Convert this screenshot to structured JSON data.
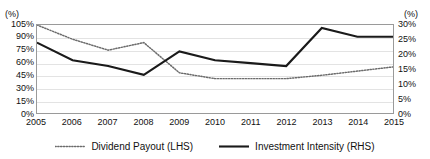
{
  "axes": {
    "left_unit": "(%)",
    "right_unit": "(%)",
    "left_ticks": [
      "105%",
      "90%",
      "75%",
      "60%",
      "45%",
      "30%",
      "15%",
      "0%"
    ],
    "right_ticks": [
      "30%",
      "25%",
      "20%",
      "15%",
      "10%",
      "5%",
      "0%"
    ]
  },
  "legend": {
    "items": [
      {
        "label": "Dividend Payout (LHS)",
        "style": "dotted",
        "color": "#6b6b6b"
      },
      {
        "label": "Investment Intensity (RHS)",
        "style": "solid",
        "color": "#1a1a1a"
      }
    ]
  },
  "chart_data": {
    "type": "line",
    "title": "",
    "xlabel": "",
    "ylabel": "(%)",
    "y2label": "(%)",
    "grid": true,
    "legend_position": "bottom",
    "categories": [
      "2005",
      "2006",
      "2007",
      "2008",
      "2009",
      "2010",
      "2011",
      "2012",
      "2013",
      "2014",
      "2015"
    ],
    "ylim": [
      0,
      105
    ],
    "y2lim": [
      0,
      30
    ],
    "yticks": [
      0,
      15,
      30,
      45,
      60,
      75,
      90,
      105
    ],
    "y2ticks": [
      0,
      5,
      10,
      15,
      20,
      25,
      30
    ],
    "series": [
      {
        "name": "Dividend Payout (LHS)",
        "axis": "left",
        "style": "dotted",
        "color": "#6b6b6b",
        "values": [
          105,
          88,
          75,
          84,
          48,
          41,
          41,
          41,
          45,
          50,
          55
        ]
      },
      {
        "name": "Investment Intensity (RHS)",
        "axis": "right",
        "style": "solid",
        "color": "#1a1a1a",
        "values": [
          24,
          18,
          16,
          13,
          21,
          18,
          17,
          16,
          29,
          26,
          26
        ]
      }
    ]
  }
}
